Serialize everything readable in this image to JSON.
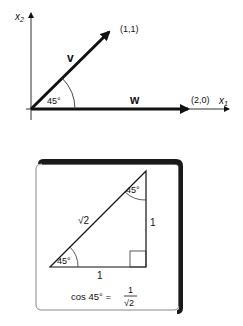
{
  "vector_plot": {
    "axis_x_label": "x",
    "axis_x_sub": "1",
    "axis_y_label": "x",
    "axis_y_sub": "2",
    "vector_v": {
      "label": "v",
      "tip": "(1,1)"
    },
    "vector_w": {
      "label": "w",
      "tip": "(2,0)"
    },
    "angle_label": "45°"
  },
  "triangle_card": {
    "hypotenuse_label": "√2",
    "vertical_side_label": "1",
    "base_label": "1",
    "top_angle_label": "45°",
    "bottom_angle_label": "45°",
    "formula": {
      "lhs": "cos 45° =",
      "numerator": "1",
      "denominator": "√2"
    }
  },
  "colors": {
    "ink": "#111111",
    "background": "#ffffff",
    "card_border": "#777777",
    "card_shadow": "#1a1a1a"
  }
}
